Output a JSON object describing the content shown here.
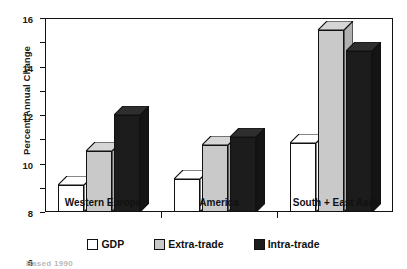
{
  "chart_data": {
    "type": "bar",
    "title": "",
    "xlabel": "",
    "ylabel": "Percent Annual Change",
    "categories": [
      "Western Europe",
      "America",
      "South + East Asia"
    ],
    "series": [
      {
        "name": "GDP",
        "values": [
          2.2,
          2.7,
          5.7
        ],
        "swatch": "#ffffff"
      },
      {
        "name": "Extra-trade",
        "values": [
          5.0,
          5.5,
          15.0
        ],
        "swatch": "#c9c9c9"
      },
      {
        "name": "Intra-trade",
        "values": [
          8.0,
          6.2,
          13.3
        ],
        "swatch": "#1c1c1c"
      }
    ],
    "ylim": [
      0,
      16
    ],
    "yticks": [
      0,
      2,
      4,
      6,
      8,
      10,
      12,
      14,
      16
    ],
    "ytick_labels": [
      "0",
      "2",
      "4",
      "6",
      "8",
      "10",
      "12",
      "14",
      "16"
    ],
    "grid": false,
    "legend_position": "bottom",
    "style": "3d-bar"
  },
  "footnote": "Based 1990"
}
